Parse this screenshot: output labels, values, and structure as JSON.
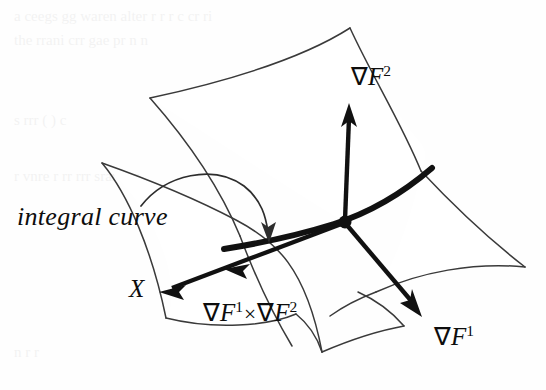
{
  "figure": {
    "kind": "mathematical-diagram",
    "background_color": "#fefefe",
    "ink_color": "#111111",
    "surface_edge_color": "#3a3a3a"
  },
  "labels": {
    "grad_f2": {
      "nabla": "∇",
      "base": "F",
      "superscript": "2"
    },
    "grad_f1": {
      "nabla": "∇",
      "base": "F",
      "superscript": "1"
    },
    "cross_product": {
      "left_nabla": "∇",
      "left_base": "F",
      "left_superscript": "1",
      "operator": "×",
      "right_nabla": "∇",
      "right_base": "F",
      "right_superscript": "2"
    },
    "vector_x": "X",
    "integral_curve": "integral curve"
  },
  "annotations": {
    "intersection_point_label": "",
    "pointer_from": "integral curve",
    "pointer_to": "integral-curve-stroke"
  },
  "geometry": {
    "node_point": {
      "x": 345,
      "y": 222
    },
    "vectors": [
      {
        "name": "grad-f2",
        "from": [
          345,
          222
        ],
        "to": [
          350,
          108
        ],
        "label": "∇F²"
      },
      {
        "name": "grad-f1",
        "from": [
          345,
          222
        ],
        "to": [
          419,
          314
        ],
        "label": "∇F¹"
      },
      {
        "name": "cross-product-x",
        "from": [
          345,
          222
        ],
        "to": [
          161,
          292
        ],
        "label": "X"
      }
    ],
    "integral_curve_path": "from (224,249) through (300,236) to (430,170)"
  }
}
